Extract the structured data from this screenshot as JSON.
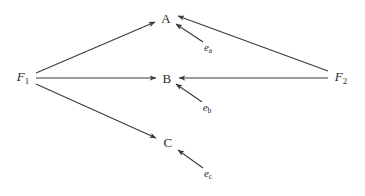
{
  "figure": {
    "type": "path-diagram",
    "background_color": "#ffffff",
    "line_color": "#3a3a3a",
    "text_color": "#2b2b2b",
    "width": 365,
    "height": 196
  },
  "nodes": {
    "indicators": [
      {
        "id": "A",
        "label": "A",
        "x": 166,
        "y": 18
      },
      {
        "id": "B",
        "label": "B",
        "x": 167,
        "y": 78
      },
      {
        "id": "C",
        "label": "C",
        "x": 168,
        "y": 142
      }
    ],
    "factors": [
      {
        "id": "F1",
        "letter": "F",
        "subscript": "1",
        "x": 23,
        "y": 78
      },
      {
        "id": "F2",
        "letter": "F",
        "subscript": "2",
        "x": 341,
        "y": 78
      }
    ],
    "errors": [
      {
        "id": "ea",
        "letter": "e",
        "subscript": "a",
        "x": 208,
        "y": 48
      },
      {
        "id": "eb",
        "letter": "e",
        "subscript": "b",
        "x": 207,
        "y": 108
      },
      {
        "id": "ec",
        "letter": "e",
        "subscript": "c",
        "x": 208,
        "y": 174
      }
    ]
  },
  "edges": [
    {
      "id": "F1-A",
      "from": "F1",
      "to": "A",
      "x1": 36,
      "y1": 73,
      "x2": 155,
      "y2": 22,
      "arrow": "to"
    },
    {
      "id": "F1-B",
      "from": "F1",
      "to": "B",
      "x1": 36,
      "y1": 78,
      "x2": 156,
      "y2": 78,
      "arrow": "to"
    },
    {
      "id": "F1-C",
      "from": "F1",
      "to": "C",
      "x1": 36,
      "y1": 84,
      "x2": 156,
      "y2": 138,
      "arrow": "to"
    },
    {
      "id": "F2-A",
      "from": "F2",
      "to": "A",
      "x1": 328,
      "y1": 71,
      "x2": 178,
      "y2": 16,
      "arrow": "to"
    },
    {
      "id": "F2-B",
      "from": "F2",
      "to": "B",
      "x1": 328,
      "y1": 78,
      "x2": 179,
      "y2": 78,
      "arrow": "to"
    },
    {
      "id": "ea-A",
      "from": "ea",
      "to": "A",
      "x1": 203,
      "y1": 42,
      "x2": 176,
      "y2": 24,
      "arrow": "to"
    },
    {
      "id": "eb-B",
      "from": "eb",
      "to": "B",
      "x1": 202,
      "y1": 102,
      "x2": 176,
      "y2": 84,
      "arrow": "to"
    },
    {
      "id": "ec-C",
      "from": "ec",
      "to": "C",
      "x1": 203,
      "y1": 168,
      "x2": 178,
      "y2": 150,
      "arrow": "to"
    }
  ]
}
